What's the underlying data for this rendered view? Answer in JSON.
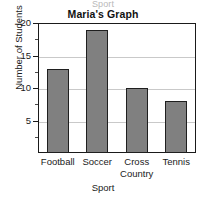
{
  "ghost_top_label": "Sport",
  "chart_data": {
    "type": "bar",
    "title": "Maria's Graph",
    "xlabel": "Sport",
    "ylabel": "Number of Students",
    "categories": [
      "Football",
      "Soccer",
      "Cross Country",
      "Tennis"
    ],
    "category_lines": [
      [
        "Football"
      ],
      [
        "Soccer"
      ],
      [
        "Cross",
        "Country"
      ],
      [
        "Tennis"
      ]
    ],
    "values": [
      13,
      19,
      10,
      8
    ],
    "ylim": [
      0,
      20
    ],
    "yticks": [
      5,
      10,
      15,
      20
    ],
    "ytick_labels": [
      "5",
      "10",
      "15",
      "20"
    ],
    "yminor_ticks": [
      2.5,
      7.5,
      12.5,
      17.5
    ],
    "grid": true,
    "legend": "none",
    "bar_color": "#808080",
    "bar_edge_color": "#1f1f1f",
    "grid_color": "#c9c9c9",
    "frame_color": "#1a1a1a"
  }
}
